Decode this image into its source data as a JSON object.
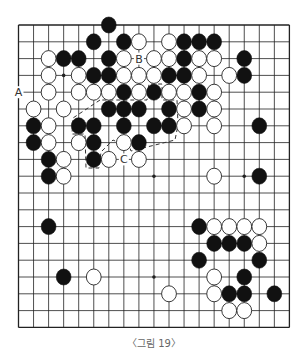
{
  "figure": {
    "caption": "〈그림 19〉"
  },
  "board": {
    "size": 19,
    "origin_x": 18.5,
    "origin_y": 25,
    "spacing_x": 15.05,
    "spacing_y": 16.8,
    "stone_rx": 7.4,
    "stone_ry": 8.0,
    "line_color": "#222222",
    "black_color": "#111111",
    "white_fill": "#ffffff",
    "star_points": [
      [
        3,
        3
      ],
      [
        9,
        3
      ],
      [
        15,
        3
      ],
      [
        3,
        9
      ],
      [
        9,
        9
      ],
      [
        15,
        9
      ],
      [
        3,
        15
      ],
      [
        9,
        15
      ],
      [
        15,
        15
      ]
    ],
    "black_stones": [
      [
        6,
        0
      ],
      [
        5,
        1
      ],
      [
        7,
        1
      ],
      [
        11,
        1
      ],
      [
        12,
        1
      ],
      [
        13,
        1
      ],
      [
        3,
        2
      ],
      [
        4,
        2
      ],
      [
        6,
        2
      ],
      [
        11,
        2
      ],
      [
        15,
        2
      ],
      [
        5,
        3
      ],
      [
        6,
        3
      ],
      [
        10,
        3
      ],
      [
        11,
        3
      ],
      [
        15,
        3
      ],
      [
        7,
        4
      ],
      [
        9,
        4
      ],
      [
        12,
        4
      ],
      [
        6,
        5
      ],
      [
        7,
        5
      ],
      [
        8,
        5
      ],
      [
        10,
        5
      ],
      [
        12,
        5
      ],
      [
        1,
        6
      ],
      [
        4,
        6
      ],
      [
        5,
        6
      ],
      [
        7,
        6
      ],
      [
        9,
        6
      ],
      [
        10,
        6
      ],
      [
        16,
        6
      ],
      [
        1,
        7
      ],
      [
        5,
        7
      ],
      [
        8,
        7
      ],
      [
        2,
        8
      ],
      [
        5,
        8
      ],
      [
        2,
        9
      ],
      [
        16,
        9
      ],
      [
        2,
        12
      ],
      [
        12,
        12
      ],
      [
        13,
        13
      ],
      [
        14,
        13
      ],
      [
        15,
        13
      ],
      [
        12,
        14
      ],
      [
        16,
        14
      ],
      [
        3,
        15
      ],
      [
        15,
        15
      ],
      [
        14,
        16
      ],
      [
        15,
        16
      ],
      [
        17,
        16
      ]
    ],
    "white_stones": [
      [
        8,
        1
      ],
      [
        10,
        1
      ],
      [
        2,
        2
      ],
      [
        7,
        2
      ],
      [
        9,
        2
      ],
      [
        10,
        2
      ],
      [
        12,
        2
      ],
      [
        13,
        2
      ],
      [
        2,
        3
      ],
      [
        4,
        3
      ],
      [
        7,
        3
      ],
      [
        8,
        3
      ],
      [
        9,
        3
      ],
      [
        12,
        3
      ],
      [
        14,
        3
      ],
      [
        2,
        4
      ],
      [
        4,
        4
      ],
      [
        5,
        4
      ],
      [
        6,
        4
      ],
      [
        8,
        4
      ],
      [
        10,
        4
      ],
      [
        11,
        4
      ],
      [
        13,
        4
      ],
      [
        1,
        5
      ],
      [
        3,
        5
      ],
      [
        11,
        5
      ],
      [
        13,
        5
      ],
      [
        2,
        6
      ],
      [
        11,
        6
      ],
      [
        13,
        6
      ],
      [
        2,
        7
      ],
      [
        4,
        7
      ],
      [
        7,
        7
      ],
      [
        3,
        8
      ],
      [
        6,
        8
      ],
      [
        8,
        8
      ],
      [
        3,
        9
      ],
      [
        13,
        9
      ],
      [
        13,
        12
      ],
      [
        14,
        12
      ],
      [
        15,
        12
      ],
      [
        16,
        12
      ],
      [
        16,
        13
      ],
      [
        5,
        15
      ],
      [
        13,
        15
      ],
      [
        10,
        16
      ],
      [
        13,
        16
      ],
      [
        14,
        17
      ],
      [
        15,
        17
      ]
    ],
    "labels": [
      {
        "text": "A",
        "col": 0,
        "row": 4
      },
      {
        "text": "B",
        "col": 8,
        "row": 2
      },
      {
        "text": "C",
        "col": 7,
        "row": 8
      }
    ],
    "dashed_outline": [
      [
        100,
        100
      ],
      [
        73,
        118
      ],
      [
        72,
        134
      ],
      [
        85,
        134
      ],
      [
        86,
        168
      ],
      [
        99,
        168
      ],
      [
        101,
        152
      ],
      [
        113,
        140
      ],
      [
        130,
        148
      ],
      [
        131,
        151
      ],
      [
        175,
        140
      ],
      [
        178,
        125
      ],
      [
        177,
        100
      ],
      [
        162,
        100
      ],
      [
        162,
        84
      ],
      [
        149,
        84
      ],
      [
        147,
        100
      ],
      [
        100,
        100
      ]
    ]
  }
}
